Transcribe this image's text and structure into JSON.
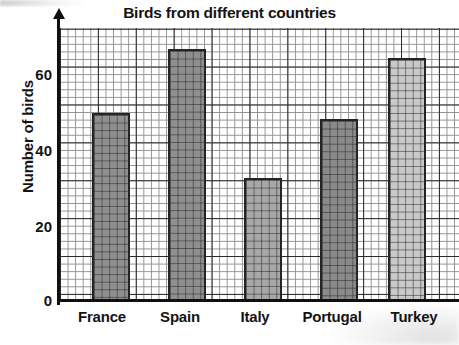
{
  "chart_data": {
    "type": "bar",
    "title": "Birds from different countries",
    "xlabel": "",
    "ylabel": "Number of birds",
    "categories": [
      "France",
      "Spain",
      "Italy",
      "Portugal",
      "Turkey"
    ],
    "values": [
      50,
      66,
      32,
      48,
      64
    ],
    "ylim": [
      0,
      72
    ],
    "yticks": [
      0,
      20,
      40,
      60
    ],
    "ytick_labels": [
      "0",
      "20",
      "40",
      "60"
    ],
    "grid": "on",
    "grid_minor_step": 2,
    "grid_major_step": 10,
    "legend": "none",
    "bar_colors": [
      "#8f8f8f",
      "#8f8f8f",
      "#a8a8a8",
      "#8a8a8a",
      "#c9c9c9"
    ],
    "bar_edge_color": "#242424",
    "axis_color": "#101010",
    "text_color": "#141414"
  },
  "layout": {
    "bars_px": [
      {
        "left": 32,
        "width": 38,
        "top": 85,
        "height": 188
      },
      {
        "left": 108,
        "width": 38,
        "top": 21,
        "height": 252
      },
      {
        "left": 184,
        "width": 38,
        "top": 150,
        "height": 123
      },
      {
        "left": 260,
        "width": 38,
        "top": 91,
        "height": 182
      },
      {
        "left": 328,
        "width": 38,
        "top": 30,
        "height": 243
      }
    ],
    "yticks_px": [
      {
        "label_index": 3,
        "top": 66
      },
      {
        "label_index": 2,
        "top": 142
      },
      {
        "label_index": 1,
        "top": 218
      },
      {
        "label_index": 0,
        "top": 292
      }
    ],
    "xticks_px": [
      {
        "left": 60,
        "width": 84
      },
      {
        "left": 140,
        "width": 80
      },
      {
        "left": 218,
        "width": 74
      },
      {
        "left": 284,
        "width": 96
      },
      {
        "left": 372,
        "width": 84
      }
    ]
  }
}
